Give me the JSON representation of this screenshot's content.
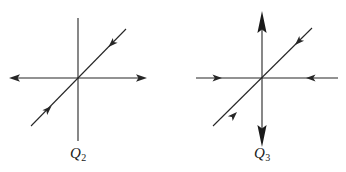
{
  "figure": {
    "type": "phase-portrait-pair",
    "background_color": "#ffffff",
    "stroke_color": "#262626",
    "stroke_width": 1.1,
    "width": 346,
    "height": 172
  },
  "diagrams": [
    {
      "id": "q2",
      "label_text": "Q",
      "label_subscript": "2",
      "origin": {
        "x": 78,
        "y": 78
      },
      "elements": [
        {
          "name": "horizontal-axis",
          "x1": 10,
          "y1": 78,
          "x2": 146,
          "y2": 78,
          "arrow_start": "outward-left",
          "arrow_end": "outward-right",
          "arrow_style": "open-thin"
        },
        {
          "name": "vertical-axis",
          "x1": 78,
          "y1": 18,
          "x2": 78,
          "y2": 141,
          "arrow_start": "none",
          "arrow_end": "none",
          "arrow_style": "none"
        },
        {
          "name": "diagonal-line",
          "x1": 31,
          "y1": 126,
          "x2": 126,
          "y2": 29,
          "slope_degrees": 45,
          "arrow_lower_left_segment": "inward-up-right",
          "arrow_upper_right_segment": "inward-down-left",
          "arrow_style": "solid-barb"
        }
      ]
    },
    {
      "id": "q3",
      "label_text": "Q",
      "label_subscript": "3",
      "origin": {
        "x": 262,
        "y": 78
      },
      "elements": [
        {
          "name": "horizontal-axis",
          "x1": 196,
          "y1": 78,
          "x2": 338,
          "y2": 78,
          "arrow_start": "inward-right",
          "arrow_end": "inward-left",
          "arrow_style": "solid-barb"
        },
        {
          "name": "vertical-axis",
          "x1": 262,
          "y1": 12,
          "x2": 262,
          "y2": 146,
          "arrow_start": "outward-up",
          "arrow_end": "outward-down",
          "arrow_style": "solid-large"
        },
        {
          "name": "diagonal-line",
          "x1": 213,
          "y1": 126,
          "x2": 312,
          "y2": 28,
          "slope_degrees": 45,
          "arrow_lower_left_segment": "inward-up-right",
          "arrow_upper_right_segment": "inward-down-left",
          "arrow_style": "solid-barb"
        }
      ]
    }
  ]
}
